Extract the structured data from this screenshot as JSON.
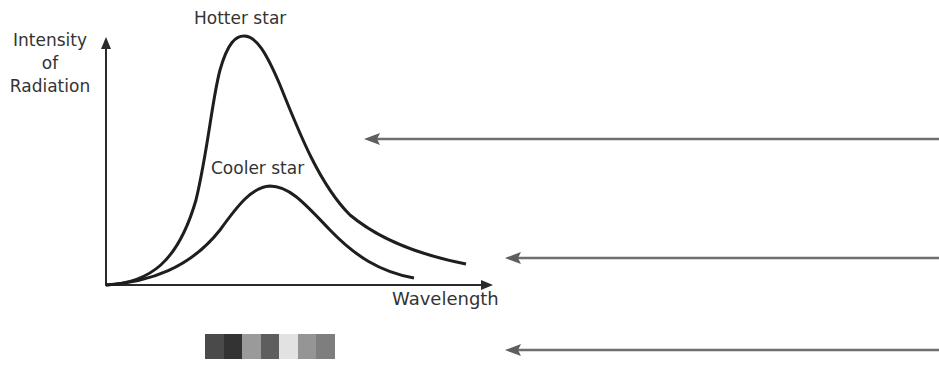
{
  "diagram": {
    "y_axis_label": "Intensity of Radiation",
    "y_axis_label_lines": [
      "Intensity",
      "of",
      "Radiation"
    ],
    "x_axis_label": "Wavelength",
    "curves": [
      {
        "name": "hotter",
        "label": "Hotter star",
        "peak_x": 244,
        "peak_y": 36
      },
      {
        "name": "cooler",
        "label": "Cooler star",
        "peak_x": 270,
        "peak_y": 186
      }
    ],
    "pointer_arrows": [
      {
        "name": "arrow-top",
        "y": 139,
        "from_x": 939,
        "to_x": 364
      },
      {
        "name": "arrow-middle",
        "y": 258,
        "from_x": 939,
        "to_x": 505
      },
      {
        "name": "arrow-bottom",
        "y": 350,
        "from_x": 939,
        "to_x": 505
      }
    ],
    "spectrum": {
      "label": "visible spectrum strip",
      "swatches": [
        "#4a4a4a",
        "#333333",
        "#9a9a9a",
        "#5e5e5e",
        "#e2e2e2",
        "#959595",
        "#7e7e7e"
      ]
    },
    "caption_cropped": "",
    "colors": {
      "curve": "#1e1e1e",
      "axis": "#2a2a2a",
      "arrow": "#6e6e6e"
    }
  }
}
